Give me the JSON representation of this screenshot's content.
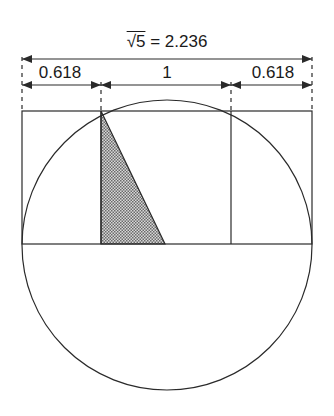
{
  "title": {
    "radical": "√5",
    "equals": "= 2.236"
  },
  "dimensions": [
    {
      "label": "0.618",
      "center_x": 60
    },
    {
      "label": "1",
      "center_x": 167
    },
    {
      "label": "0.618",
      "center_x": 273
    }
  ],
  "colors": {
    "line": "#2a2a2a",
    "hatch": "#b8b8b8",
    "background": "#ffffff"
  }
}
